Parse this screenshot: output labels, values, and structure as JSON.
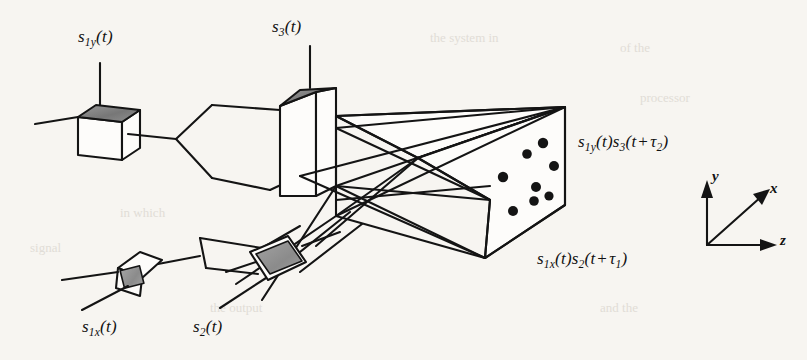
{
  "figure": {
    "type": "optical-transducer-diagram",
    "background_color": "#f7f5f1",
    "ink_color": "#141414",
    "shade_color": "#8a8a8a"
  },
  "transducers": [
    {
      "id": "s1y",
      "label": "s",
      "sub": "1y",
      "arg": "(t)",
      "shape": "cube-with-shaded-top",
      "label_x": 78,
      "label_y": 28
    },
    {
      "id": "s3",
      "label": "s",
      "sub": "3",
      "arg": "(t)",
      "shape": "tall-box-with-shaded-top",
      "label_x": 272,
      "label_y": 18
    },
    {
      "id": "s1x",
      "label": "s",
      "sub": "1x",
      "arg": "(t)",
      "shape": "small-tilted-cube",
      "label_x": 82,
      "label_y": 318
    },
    {
      "id": "s2",
      "label": "s",
      "sub": "2",
      "arg": "(t)",
      "shape": "tilted-square-shaded",
      "label_x": 193,
      "label_y": 318
    }
  ],
  "output_labels": [
    {
      "id": "upper-output",
      "s_a": "s",
      "sub_a": "1y",
      "arg_a": "(t)",
      "s_b": "s",
      "sub_b": "3",
      "open": "(t",
      "plus": "+",
      "tau": "τ",
      "tau_sub": "2",
      "close": ")",
      "x": 578,
      "y": 133
    },
    {
      "id": "lower-output",
      "s_a": "s",
      "sub_a": "1x",
      "arg_a": "(t)",
      "s_b": "s",
      "sub_b": "2",
      "open": "(t",
      "plus": "+",
      "tau": "τ",
      "tau_sub": "1",
      "close": ")",
      "x": 537,
      "y": 250
    }
  ],
  "axes": {
    "origin_x": 707,
    "origin_y": 245,
    "labels": [
      {
        "id": "axis-y",
        "text": "y",
        "x": 712,
        "y": 168
      },
      {
        "id": "axis-x",
        "text": "x",
        "x": 770,
        "y": 180
      },
      {
        "id": "axis-z",
        "text": "z",
        "x": 780,
        "y": 232
      }
    ]
  },
  "bragg_cell": {
    "description": "parallelepiped volume with scattered output spots on front face",
    "spot_count": 8,
    "spots": [
      {
        "x": 543,
        "y": 143
      },
      {
        "x": 527,
        "y": 154
      },
      {
        "x": 554,
        "y": 166
      },
      {
        "x": 503,
        "y": 177
      },
      {
        "x": 536,
        "y": 187
      },
      {
        "x": 534,
        "y": 201
      },
      {
        "x": 513,
        "y": 211
      },
      {
        "x": 549,
        "y": 196
      }
    ]
  },
  "page_bleed": [
    {
      "text": "the system in",
      "x": 430,
      "y": 30
    },
    {
      "text": "of the",
      "x": 620,
      "y": 40
    },
    {
      "text": "in which",
      "x": 120,
      "y": 205
    },
    {
      "text": "signal",
      "x": 30,
      "y": 240
    },
    {
      "text": "the output",
      "x": 210,
      "y": 300
    },
    {
      "text": "and the",
      "x": 600,
      "y": 300
    },
    {
      "text": "processor",
      "x": 640,
      "y": 90
    }
  ]
}
